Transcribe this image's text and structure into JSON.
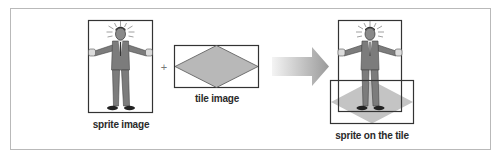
{
  "diagram": {
    "panels": [
      {
        "id": "sprite",
        "label": "sprite image"
      },
      {
        "id": "tile",
        "label": "tile image"
      },
      {
        "id": "result",
        "label": "sprite on the tile"
      }
    ],
    "operator": "+",
    "arrow": "right-arrow",
    "colors": {
      "frame_border": "#b9b9b9",
      "box_border": "#333333",
      "tile_fill": "#b8b8b8",
      "tile_stroke": "#555555",
      "result_tile_fill": "#c4c4c4",
      "arrow_start": "#f2f2f2",
      "arrow_end": "#9a9a9a",
      "suit": "#7c7c7c"
    }
  }
}
